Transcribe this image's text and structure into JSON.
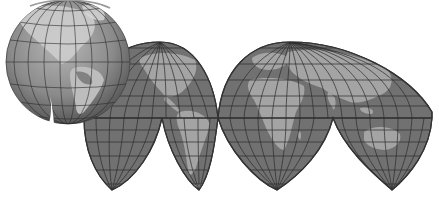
{
  "illustration": {
    "description": "Globe beside Goode homolosine interrupted world map projection",
    "background": "#ffffff",
    "colors": {
      "ocean": "#6f6f6f",
      "land": "#a3a3a3",
      "graticule": "#2a2a2a",
      "outline": "#3a3a3a",
      "globe_dark": "#4a4a4a",
      "globe_light": "#c8c8c8"
    },
    "globe": {
      "cx": 68,
      "cy": 62,
      "r": 62
    },
    "map": {
      "equator_y": 118,
      "north_lobes": [
        {
          "name": "americas-north",
          "x_left": 84,
          "x_right": 218,
          "top_x": 160,
          "top_y": 42
        },
        {
          "name": "eurasia",
          "x_left": 218,
          "x_right": 432,
          "top_x": 290,
          "top_y": 42
        }
      ],
      "south_lobes": [
        {
          "name": "pacific-south-west",
          "x_left": 84,
          "x_right": 162,
          "bottom_x": 112,
          "bottom_y": 190
        },
        {
          "name": "south-america",
          "x_left": 162,
          "x_right": 218,
          "bottom_x": 199,
          "bottom_y": 190
        },
        {
          "name": "africa-south",
          "x_left": 218,
          "x_right": 333,
          "bottom_x": 277,
          "bottom_y": 190
        },
        {
          "name": "australia",
          "x_left": 333,
          "x_right": 432,
          "bottom_x": 392,
          "bottom_y": 190
        }
      ]
    }
  }
}
